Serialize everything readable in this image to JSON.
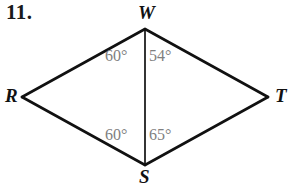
{
  "problem": {
    "number": "11."
  },
  "figure": {
    "type": "quadrilateral-with-diagonal",
    "name": "rhombus-rwts",
    "stroke_color": "#111111",
    "label_color": "#111111",
    "angle_color": "#808080",
    "background": "#ffffff",
    "vertices": [
      {
        "id": "W",
        "label": "W",
        "x": 145,
        "y": 29,
        "position": "top"
      },
      {
        "id": "R",
        "label": "R",
        "x": 22,
        "y": 97,
        "position": "left"
      },
      {
        "id": "T",
        "label": "T",
        "x": 268,
        "y": 97,
        "position": "right"
      },
      {
        "id": "S",
        "label": "S",
        "x": 145,
        "y": 165,
        "position": "bottom"
      }
    ],
    "edges": [
      {
        "from": "W",
        "to": "R",
        "kind": "side"
      },
      {
        "from": "W",
        "to": "T",
        "kind": "side"
      },
      {
        "from": "R",
        "to": "S",
        "kind": "side"
      },
      {
        "from": "T",
        "to": "S",
        "kind": "side"
      },
      {
        "from": "W",
        "to": "S",
        "kind": "diagonal"
      }
    ],
    "angles": [
      {
        "id": "RWS",
        "vertex": "W",
        "label": "60°",
        "value": 60,
        "side": "left",
        "x": 105,
        "y": 48
      },
      {
        "id": "SWT",
        "vertex": "W",
        "label": "54°",
        "value": 54,
        "side": "right",
        "x": 149,
        "y": 48
      },
      {
        "id": "RSW",
        "vertex": "S",
        "label": "60°",
        "value": 60,
        "side": "left",
        "x": 105,
        "y": 127
      },
      {
        "id": "WST",
        "vertex": "S",
        "label": "65°",
        "value": 65,
        "side": "right",
        "x": 149,
        "y": 127
      }
    ]
  }
}
